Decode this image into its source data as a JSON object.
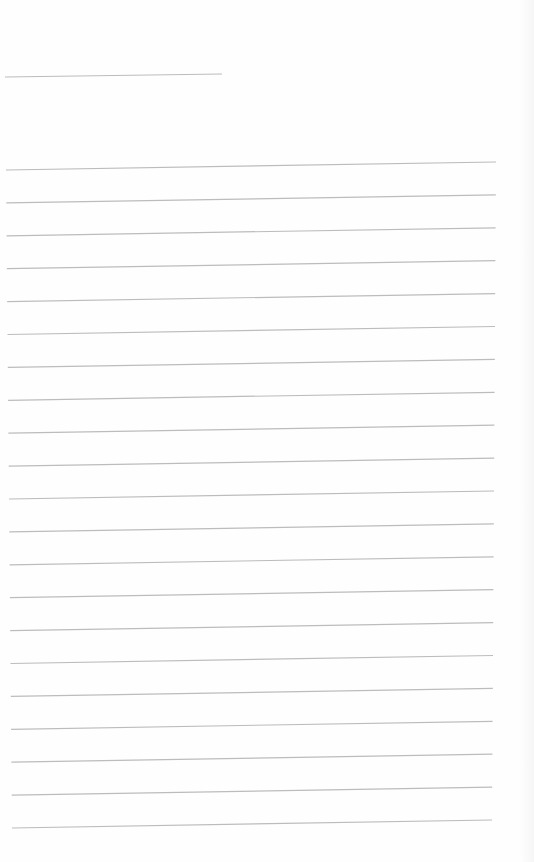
{
  "page": {
    "type": "ruled-blank-sheet",
    "background": "#fefefe",
    "line_color": "#bcbcbc",
    "header_line": {
      "x1": 5,
      "y1": 77,
      "x2": 222,
      "y2": 74
    },
    "ruled_lines": {
      "count": 21,
      "x_start": 6,
      "x_end": 496,
      "y_first_left": 170,
      "spacing": 32.9,
      "rise": 8
    }
  }
}
